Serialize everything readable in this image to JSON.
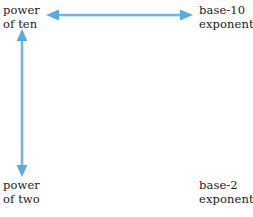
{
  "diagram": {
    "type": "relationship-diagram",
    "width": 253,
    "height": 217,
    "background_color": "#ffffff",
    "arrow_color": "#5ba9de",
    "text_color": "#1b1b1b",
    "labels": {
      "top_left": {
        "name": "power-of-ten",
        "line1": "power",
        "line2": "of ten",
        "x": 3,
        "y": 4
      },
      "top_right": {
        "name": "base-10-exponent",
        "line1": "base-10",
        "line2": "exponent",
        "x": 199,
        "y": 4
      },
      "bottom_left": {
        "name": "power-of-two",
        "line1": "power",
        "line2": "of two",
        "x": 3,
        "y": 179
      },
      "bottom_right": {
        "name": "base-2-exponent",
        "line1": "base-2",
        "line2": "exponent",
        "x": 199,
        "y": 179
      }
    },
    "arrows": [
      {
        "name": "horizontal-double-arrow",
        "orientation": "horizontal",
        "double_headed": true,
        "from": "power of ten",
        "to": "base-10 exponent",
        "x1": 46,
        "y1": 15,
        "x2": 193,
        "y2": 15,
        "color": "#5ba9de"
      },
      {
        "name": "vertical-double-arrow",
        "orientation": "vertical",
        "double_headed": true,
        "from": "power of ten",
        "to": "power of two",
        "x1": 22,
        "y1": 29,
        "x2": 22,
        "y2": 177,
        "color": "#5ba9de"
      }
    ]
  }
}
